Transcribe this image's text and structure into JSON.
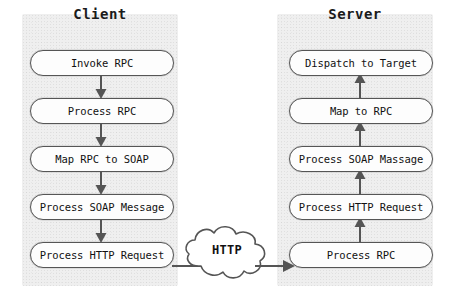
{
  "diagram": {
    "type": "flowchart",
    "background_color": "#ffffff",
    "panel_color": "#efefef",
    "stroke_color": "#555555",
    "text_color": "#111111"
  },
  "client": {
    "header": "Client",
    "steps": [
      {
        "label": "Invoke RPC"
      },
      {
        "label": "Process RPC"
      },
      {
        "label": "Map RPC to SOAP"
      },
      {
        "label": "Process SOAP Message"
      },
      {
        "label": "Process HTTP Request"
      }
    ],
    "flow_direction": "downward"
  },
  "server": {
    "header": "Server",
    "steps": [
      {
        "label": "Dispatch to Target"
      },
      {
        "label": "Map to RPC"
      },
      {
        "label": "Process SOAP Massage"
      },
      {
        "label": "Process HTTP Request"
      },
      {
        "label": "Process RPC"
      }
    ],
    "flow_direction": "upward"
  },
  "transport": {
    "label": "HTTP",
    "shape": "cloud",
    "from": "Process HTTP Request",
    "to": "Process RPC"
  }
}
